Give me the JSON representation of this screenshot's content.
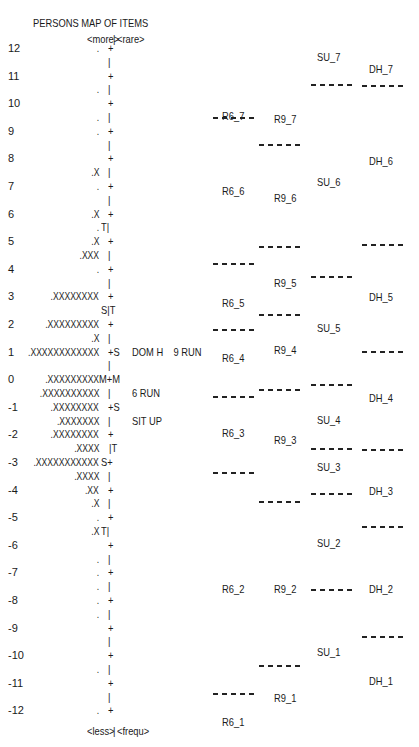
{
  "chart_data": {
    "type": "table",
    "title": "PERSONS MAP OF ITEMS",
    "subtitle": "Wright map (person-item map)",
    "top_labels": {
      "left": "<more>",
      "right": "<rare>"
    },
    "bottom_labels": {
      "left": "<less>",
      "right": "<frequ>"
    },
    "axis_ticks": [
      "12",
      "11",
      "10",
      "9",
      "8",
      "7",
      "6",
      "5",
      "4",
      "3",
      "2",
      "1",
      "0",
      "-1",
      "-2",
      "-3",
      "-4",
      "-5",
      "-6",
      "-7",
      "-8",
      "-9",
      "-10",
      "-11",
      "-12"
    ],
    "ylim": [
      -12,
      12
    ],
    "person_rows": [
      {
        "y": 12,
        "persons": ".",
        "mark": "+"
      },
      {
        "y": 11.5,
        "persons": "",
        "mark": "|"
      },
      {
        "y": 11,
        "persons": "",
        "mark": "+"
      },
      {
        "y": 10.5,
        "persons": ".",
        "mark": "|"
      },
      {
        "y": 10,
        "persons": "",
        "mark": "+"
      },
      {
        "y": 9.5,
        "persons": ".",
        "mark": "|"
      },
      {
        "y": 9,
        "persons": ".",
        "mark": "+"
      },
      {
        "y": 8.5,
        "persons": "",
        "mark": "|"
      },
      {
        "y": 8,
        "persons": "",
        "mark": "+"
      },
      {
        "y": 7.5,
        "persons": ".X",
        "mark": "|"
      },
      {
        "y": 7,
        "persons": ".",
        "mark": "+"
      },
      {
        "y": 6.5,
        "persons": "",
        "mark": "|"
      },
      {
        "y": 6,
        "persons": ".X",
        "mark": "+"
      },
      {
        "y": 5.5,
        "persons": ".",
        "mark": "T|"
      },
      {
        "y": 5,
        "persons": ".X",
        "mark": "+"
      },
      {
        "y": 4.5,
        "persons": ".XXX",
        "mark": "|"
      },
      {
        "y": 4,
        "persons": ".",
        "mark": "+"
      },
      {
        "y": 3.5,
        "persons": "",
        "mark": "|"
      },
      {
        "y": 3,
        "persons": ".XXXXXXXX",
        "mark": "+"
      },
      {
        "y": 2.5,
        "persons": "",
        "mark": "S|T"
      },
      {
        "y": 2,
        "persons": ".XXXXXXXXX",
        "mark": "+"
      },
      {
        "y": 1.5,
        "persons": ".X",
        "mark": "|"
      },
      {
        "y": 1,
        "persons": ".XXXXXXXXXXXX",
        "mark": "+S",
        "items": "DOM H    9 RUN"
      },
      {
        "y": 0.5,
        "persons": "",
        "mark": "|"
      },
      {
        "y": 0,
        "persons": ".XXXXXXXXX",
        "mark": "M+M"
      },
      {
        "y": -0.5,
        "persons": ".XXXXXXXXXX",
        "mark": "|",
        "items": "6 RUN"
      },
      {
        "y": -1,
        "persons": ".XXXXXXXX",
        "mark": "+S"
      },
      {
        "y": -1.5,
        "persons": ".XXXXXXX",
        "mark": "|",
        "items": "SIT UP"
      },
      {
        "y": -2,
        "persons": ".XXXXXXXX",
        "mark": "+"
      },
      {
        "y": -2.5,
        "persons": ".XXXX",
        "mark": "|T"
      },
      {
        "y": -3,
        "persons": ".XXXXXXXXXXX",
        "mark": "S+"
      },
      {
        "y": -3.5,
        "persons": ".XXXX",
        "mark": "|"
      },
      {
        "y": -4,
        "persons": ".XX",
        "mark": "+"
      },
      {
        "y": -4.5,
        "persons": ".X",
        "mark": "|"
      },
      {
        "y": -5,
        "persons": ".",
        "mark": "+"
      },
      {
        "y": -5.5,
        "persons": ".X",
        "mark": "T|"
      },
      {
        "y": -6,
        "persons": "",
        "mark": "+"
      },
      {
        "y": -6.5,
        "persons": ".",
        "mark": "|"
      },
      {
        "y": -7,
        "persons": ".",
        "mark": "+"
      },
      {
        "y": -7.5,
        "persons": ".",
        "mark": "|"
      },
      {
        "y": -8,
        "persons": ".",
        "mark": "+"
      },
      {
        "y": -8.5,
        "persons": ".",
        "mark": "|"
      },
      {
        "y": -9,
        "persons": "",
        "mark": "+"
      },
      {
        "y": -9.5,
        "persons": "",
        "mark": "|"
      },
      {
        "y": -10,
        "persons": "",
        "mark": "+"
      },
      {
        "y": -10.5,
        "persons": ".",
        "mark": "|"
      },
      {
        "y": -11,
        "persons": "",
        "mark": "+"
      },
      {
        "y": -11.5,
        "persons": "",
        "mark": "|"
      },
      {
        "y": -12,
        "persons": ".",
        "mark": "+"
      }
    ],
    "items": [
      {
        "name": "DOM H",
        "measure": 1
      },
      {
        "name": "9 RUN",
        "measure": 1
      },
      {
        "name": "6 RUN",
        "measure": -0.5
      },
      {
        "name": "SIT UP",
        "measure": -1.5
      }
    ],
    "threshold_columns": [
      {
        "item": "R6",
        "labels": [
          {
            "label": "R6_7",
            "top": 110
          },
          {
            "label": "R6_6",
            "top": 185
          },
          {
            "label": "R6_5",
            "top": 297
          },
          {
            "label": "R6_4",
            "top": 352
          },
          {
            "label": "R6_3",
            "top": 427
          },
          {
            "label": "R6_2",
            "top": 583
          },
          {
            "label": "R6_1",
            "top": 716
          }
        ],
        "dashes": [
          117,
          263,
          329,
          396,
          472,
          693
        ]
      },
      {
        "item": "R9",
        "labels": [
          {
            "label": "R9_7",
            "top": 113
          },
          {
            "label": "R9_6",
            "top": 192
          },
          {
            "label": "R9_5",
            "top": 277
          },
          {
            "label": "R9_4",
            "top": 344
          },
          {
            "label": "R9_3",
            "top": 434
          },
          {
            "label": "R9_2",
            "top": 583
          },
          {
            "label": "R9_1",
            "top": 692
          }
        ],
        "dashes": [
          144,
          246,
          314,
          389,
          501,
          665
        ]
      },
      {
        "item": "SU",
        "labels": [
          {
            "label": "SU_7",
            "top": 51
          },
          {
            "label": "SU_6",
            "top": 176
          },
          {
            "label": "SU_5",
            "top": 322
          },
          {
            "label": "SU_4",
            "top": 414
          },
          {
            "label": "SU_3",
            "top": 461
          },
          {
            "label": "SU_2",
            "top": 537
          },
          {
            "label": "SU_1",
            "top": 646
          }
        ],
        "dashes": [
          84,
          276,
          384,
          448,
          493,
          589
        ]
      },
      {
        "item": "DH",
        "labels": [
          {
            "label": "DH_7",
            "top": 63
          },
          {
            "label": "DH_6",
            "top": 155
          },
          {
            "label": "DH_5",
            "top": 291
          },
          {
            "label": "DH_4",
            "top": 392
          },
          {
            "label": "DH_3",
            "top": 485
          },
          {
            "label": "DH_2",
            "top": 583
          },
          {
            "label": "DH_1",
            "top": 675
          }
        ],
        "dashes": [
          85,
          244,
          351,
          449,
          526,
          636
        ]
      }
    ]
  }
}
